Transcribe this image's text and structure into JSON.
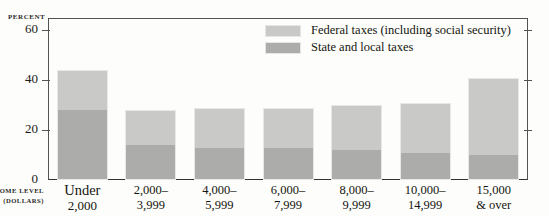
{
  "chart_data": {
    "type": "bar",
    "subtype": "stacked",
    "title": "",
    "ylabel": "PERCENT",
    "xlabel": "INCOME LEVEL (DOLLARS)",
    "xlabel_line1": "INCOME LEVEL",
    "xlabel_line2": "(DOLLARS)",
    "ylim": [
      0,
      65
    ],
    "yticks": [
      0,
      20,
      40,
      60
    ],
    "ytick_labels": [
      "0",
      "20",
      "40",
      "60"
    ],
    "grid": false,
    "legend_position": "top-right",
    "categories": [
      "Under 2,000",
      "2,000–3,999",
      "4,000–5,999",
      "6,000–7,999",
      "8,000–9,999",
      "10,000–14,999",
      "15,000 & over"
    ],
    "category_lines": [
      [
        "Under",
        "2,000"
      ],
      [
        "2,000–",
        "3,999"
      ],
      [
        "4,000–",
        "5,999"
      ],
      [
        "6,000–",
        "7,999"
      ],
      [
        "8,000–",
        "9,999"
      ],
      [
        "10,000–",
        "14,999"
      ],
      [
        "15,000",
        "& over"
      ]
    ],
    "series": [
      {
        "name": "State and local taxes",
        "color": "#acacaa",
        "values": [
          28,
          14,
          13,
          13,
          12,
          11,
          10
        ]
      },
      {
        "name": "Federal taxes (including social security)",
        "color": "#c9c9c7",
        "values": [
          16,
          14,
          16,
          16,
          18,
          20,
          31
        ]
      }
    ],
    "totals": [
      44,
      28,
      29,
      29,
      30,
      31,
      41
    ],
    "legend": [
      {
        "label": "Federal taxes (including social security)",
        "swatch": "federal",
        "color": "#c9c9c7"
      },
      {
        "label": "State and local taxes",
        "swatch": "state",
        "color": "#acacaa"
      }
    ]
  }
}
